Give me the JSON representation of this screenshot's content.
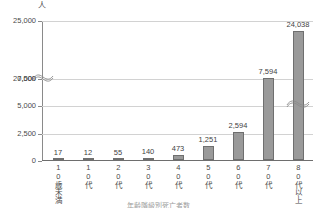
{
  "unit_label": "人",
  "caption": "年齢階級別死亡者数",
  "chart_data": {
    "type": "bar",
    "title": "",
    "subtitle": "",
    "xlabel": "",
    "ylabel": "人",
    "categories": [
      "10歳未満",
      "10代",
      "20代",
      "30代",
      "40代",
      "50代",
      "60代",
      "70代",
      "80代以上"
    ],
    "values": [
      17,
      12,
      55,
      140,
      473,
      1251,
      2594,
      7594,
      24038
    ],
    "value_labels": [
      "17",
      "12",
      "55",
      "140",
      "473",
      "1,251",
      "2,594",
      "7,594",
      "24,038"
    ],
    "ytick_labels": [
      "0",
      "2,500",
      "5,000",
      "7,500",
      "20,000",
      "25,000"
    ],
    "ytick_values": [
      0,
      2500,
      5000,
      7500,
      20000,
      25000
    ],
    "ylim": [
      0,
      25000
    ],
    "axis_break": {
      "present": true,
      "between": [
        7500,
        20000
      ],
      "broken_bar_index": 8
    },
    "grid": true,
    "legend": false,
    "bar_color": "#9a9a9a",
    "bar_border_color": "#6f6f6f",
    "grid_color": "#d2d2d2",
    "axis_color": "#8a8a8a",
    "text_color": "#4a4a4a"
  }
}
